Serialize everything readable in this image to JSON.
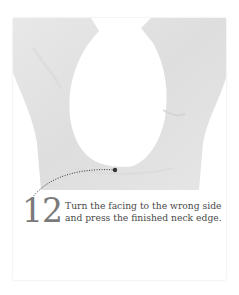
{
  "figure": {
    "image_description": "Garment neckline with facing turned to wrong side, light gray fabric on white background",
    "colors": {
      "fabric": "#e4e4e4",
      "fabric_shadow": "#d6d6d6",
      "background": "#ffffff",
      "leader_line": "#333333",
      "step_number": "#7a7a7a",
      "text": "#4a4a4a"
    }
  },
  "step": {
    "number": "12",
    "text_line_1": "Turn the facing to the wrong side",
    "text_line_2": "and press the finished neck edge."
  }
}
